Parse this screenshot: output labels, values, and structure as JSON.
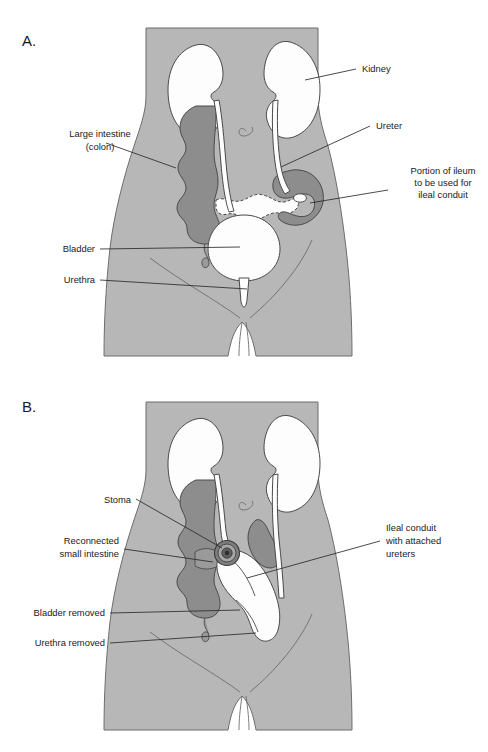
{
  "figure": {
    "background_color": "#ffffff",
    "body_fill_color": "#b7b7b7",
    "body_outline_color": "#6d6d6d",
    "colon_fill_color": "#8d8d8d",
    "organ_white_color": "#fdfdfd",
    "leader_line_color": "#2b2b2b",
    "text_color": "#1a1a1a"
  },
  "panels": [
    {
      "id": "panel-a",
      "letter": "A.",
      "caption": "Before surgery: anatomy showing kidneys, ureters, bladder, urethra, large intestine and the portion of ileum selected for the conduit",
      "labels": [
        {
          "key": "kidney",
          "text": "Kidney",
          "lines": [
            "Kidney"
          ],
          "side": "right"
        },
        {
          "key": "ureter",
          "text": "Ureter",
          "lines": [
            "Ureter"
          ],
          "side": "right"
        },
        {
          "key": "ileum",
          "text": "Portion of ileum to be used for ileal conduit",
          "lines": [
            "Portion of ileum",
            "to be used for",
            "ileal conduit"
          ],
          "side": "right"
        },
        {
          "key": "colon",
          "text": "Large intestine (colon)",
          "lines": [
            "Large intestine",
            "(colon)"
          ],
          "side": "left"
        },
        {
          "key": "bladder",
          "text": "Bladder",
          "lines": [
            "Bladder"
          ],
          "side": "left"
        },
        {
          "key": "urethra",
          "text": "Urethra",
          "lines": [
            "Urethra"
          ],
          "side": "left"
        }
      ]
    },
    {
      "id": "panel-b",
      "letter": "B.",
      "caption": "After surgery: ileal conduit with attached ureters draining through an abdominal stoma; bladder and urethra removed",
      "labels": [
        {
          "key": "stoma",
          "text": "Stoma",
          "lines": [
            "Stoma"
          ],
          "side": "left"
        },
        {
          "key": "reconnected",
          "text": "Reconnected small intestine",
          "lines": [
            "Reconnected",
            "small intestine"
          ],
          "side": "left"
        },
        {
          "key": "bladder-removed",
          "text": "Bladder removed",
          "lines": [
            "Bladder removed"
          ],
          "side": "left"
        },
        {
          "key": "urethra-removed",
          "text": "Urethra removed",
          "lines": [
            "Urethra removed"
          ],
          "side": "left"
        },
        {
          "key": "conduit",
          "text": "Ileal conduit with attached ureters",
          "lines": [
            "Ileal conduit",
            "with attached",
            "ureters"
          ],
          "side": "right"
        }
      ]
    }
  ],
  "a_labels": {
    "kidney": "Kidney",
    "ureter": "Ureter",
    "ileum_1": "Portion of ileum",
    "ileum_2": "to be used for",
    "ileum_3": "ileal conduit",
    "colon_1": "Large intestine",
    "colon_2": "(colon)",
    "bladder": "Bladder",
    "urethra": "Urethra",
    "letter": "A."
  },
  "b_labels": {
    "stoma": "Stoma",
    "reconnected_1": "Reconnected",
    "reconnected_2": "small intestine",
    "bladder_removed": "Bladder removed",
    "urethra_removed": "Urethra removed",
    "conduit_1": "Ileal conduit",
    "conduit_2": "with attached",
    "conduit_3": "ureters",
    "letter": "B."
  }
}
